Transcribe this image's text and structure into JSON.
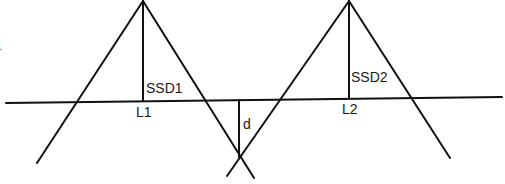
{
  "diagram": {
    "labels": {
      "ssd1": "SSD1",
      "ssd2": "SSD2",
      "l1": "L1",
      "l2": "L2",
      "d": "d",
      "edge_glyph": "1"
    },
    "colors": {
      "line": "#111111",
      "text": "#1a1a1a",
      "background": "#ffffff"
    }
  }
}
